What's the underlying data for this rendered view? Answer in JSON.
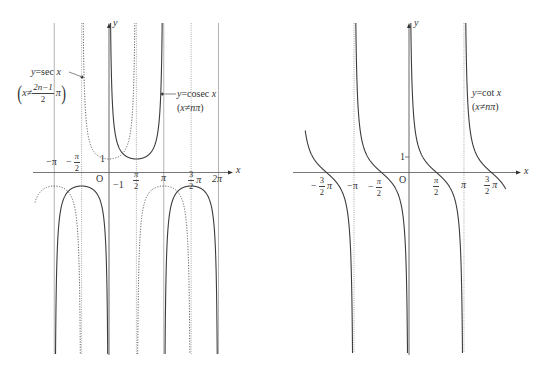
{
  "figure": {
    "left_plot": {
      "axis_x_label": "x",
      "axis_y_label": "y",
      "origin_label": "O",
      "sec_label": {
        "lhs": "y",
        "rhs": "=sec ",
        "var": "x"
      },
      "sec_condition": {
        "open": "(",
        "lhs": "x≠",
        "num": "2n−1",
        "den": "2",
        "pi": "π",
        "close": ")"
      },
      "cosec_label": {
        "lhs": "y",
        "rhs": "=cosec ",
        "var": "x"
      },
      "cosec_condition": {
        "open": "(",
        "body": "x≠nπ",
        "close": ")"
      },
      "tick_labels": {
        "neg_pi": "−π",
        "neg_half_pi": {
          "sign": "−",
          "num": "π",
          "den": "2"
        },
        "y_one": "1",
        "y_neg_one": "−1",
        "half_pi": {
          "num": "π",
          "den": "2"
        },
        "pi": "π",
        "three_half_pi": {
          "num": "3",
          "den": "2",
          "suffix": "π"
        },
        "two_pi": "2π"
      }
    },
    "right_plot": {
      "axis_x_label": "x",
      "axis_y_label": "y",
      "origin_label": "O",
      "cot_label": {
        "lhs": "y",
        "rhs": "=cot ",
        "var": "x"
      },
      "cot_condition": {
        "open": "(",
        "body": "x≠nπ",
        "close": ")"
      },
      "tick_labels": {
        "neg_three_half_pi": {
          "sign": "−",
          "num": "3",
          "den": "2",
          "suffix": "π"
        },
        "neg_pi": "−π",
        "neg_half_pi": {
          "sign": "−",
          "num": "π",
          "den": "2"
        },
        "y_one": "1",
        "half_pi": {
          "num": "π",
          "den": "2"
        },
        "pi": "π",
        "three_half_pi": {
          "num": "3",
          "den": "2",
          "suffix": "π"
        }
      }
    }
  },
  "colors": {
    "curve": "#3c3c3c",
    "dotted_curve": "#555555",
    "asymptote": "#a0a0a0",
    "axis": "#555555",
    "text": "#333333"
  },
  "chart_data": [
    {
      "id": "sec-cosec",
      "type": "line",
      "title": "y = sec x (dotted), y = cosec x (solid)",
      "xlabel": "x",
      "ylabel": "y",
      "xlim": [
        -4.3,
        7.0
      ],
      "ylim": [
        -13.5,
        11
      ],
      "grid": false,
      "legend": "inline annotations",
      "xticks": [
        {
          "value": -3.1416,
          "label": "−π"
        },
        {
          "value": -1.5708,
          "label": "−π/2"
        },
        {
          "value": 1.5708,
          "label": "π/2"
        },
        {
          "value": 3.1416,
          "label": "π"
        },
        {
          "value": 4.7124,
          "label": "3π/2"
        },
        {
          "value": 6.2832,
          "label": "2π"
        }
      ],
      "yticks": [
        {
          "value": 1,
          "label": "1"
        },
        {
          "value": -1,
          "label": "−1"
        }
      ],
      "asymptotes": {
        "solid": [
          -3.1416,
          3.1416,
          6.2832
        ],
        "dotted": [
          -1.5708,
          1.5708,
          4.7124
        ]
      },
      "series": [
        {
          "id": "sec",
          "name": "y = sec x",
          "fn": "sec",
          "style": "dotted",
          "condition": "x ≠ (2n−1)π/2",
          "branches": [
            [
              -4.245,
              -1.5708
            ],
            [
              -1.5708,
              1.5708
            ],
            [
              1.5708,
              4.7124
            ]
          ],
          "key_points": [
            {
              "x": -3.1416,
              "y": -1
            },
            {
              "x": 0,
              "y": 1
            },
            {
              "x": 3.1416,
              "y": -1
            }
          ]
        },
        {
          "id": "cosec",
          "name": "y = cosec x",
          "fn": "cosec",
          "style": "solid",
          "condition": "x ≠ nπ",
          "branches": [
            [
              -3.1416,
              0
            ],
            [
              0,
              3.1416
            ],
            [
              3.1416,
              6.2832
            ]
          ],
          "key_points": [
            {
              "x": -1.5708,
              "y": -1
            },
            {
              "x": 1.5708,
              "y": 1
            },
            {
              "x": 4.7124,
              "y": -1
            }
          ]
        }
      ]
    },
    {
      "id": "cot",
      "type": "line",
      "title": "y = cot x",
      "xlabel": "x",
      "ylabel": "y",
      "xlim": [
        -6.6,
        6.3
      ],
      "ylim": [
        -11.7,
        9.6
      ],
      "grid": false,
      "legend": "inline annotation",
      "xticks": [
        {
          "value": -4.7124,
          "label": "−3π/2"
        },
        {
          "value": -3.1416,
          "label": "−π"
        },
        {
          "value": -1.5708,
          "label": "−π/2"
        },
        {
          "value": 1.5708,
          "label": "π/2"
        },
        {
          "value": 3.1416,
          "label": "π"
        },
        {
          "value": 4.7124,
          "label": "3π/2"
        }
      ],
      "yticks": [
        {
          "value": 1,
          "label": "1"
        }
      ],
      "asymptotes": {
        "solid": [],
        "dotted": [
          -3.1416,
          3.1416
        ]
      },
      "series": [
        {
          "id": "cot",
          "name": "y = cot x",
          "fn": "cot",
          "style": "solid",
          "condition": "x ≠ nπ",
          "branches": [
            [
              -5.93,
              -3.1416
            ],
            [
              -3.1416,
              0
            ],
            [
              0,
              3.1416
            ],
            [
              3.1416,
              5.53
            ]
          ],
          "key_points": [
            {
              "x": -4.7124,
              "y": 0
            },
            {
              "x": -1.5708,
              "y": 0
            },
            {
              "x": 0.7854,
              "y": 1
            },
            {
              "x": 1.5708,
              "y": 0
            },
            {
              "x": 4.7124,
              "y": 0
            }
          ]
        }
      ]
    }
  ]
}
